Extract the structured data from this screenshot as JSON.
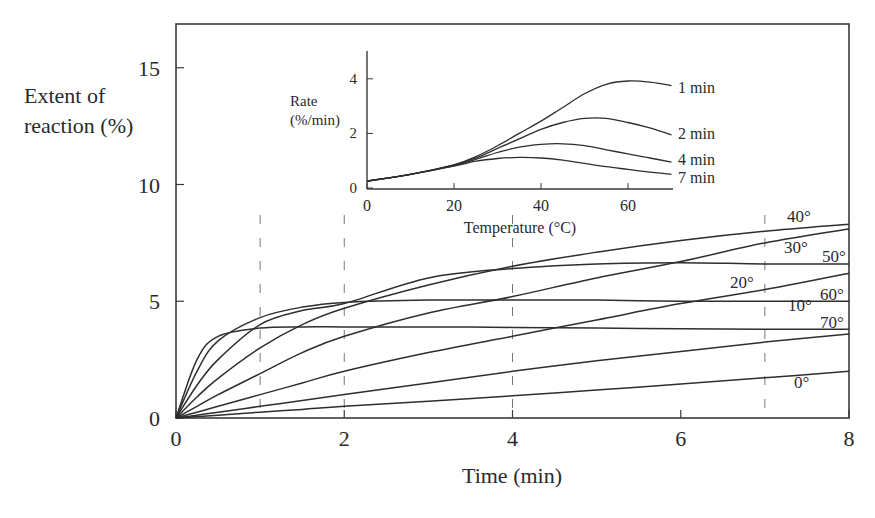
{
  "chart_data": [
    {
      "type": "line",
      "title": "",
      "xlabel": "Time (min)",
      "ylabel": "Extent of reaction (%)",
      "ylabel_lines": [
        "Extent of",
        "reaction (%)"
      ],
      "xlim": [
        0,
        8
      ],
      "ylim": [
        0,
        17
      ],
      "xticks": [
        0,
        2,
        4,
        6,
        8
      ],
      "xtick_labels": [
        "0",
        "2",
        "4",
        "6",
        "8"
      ],
      "minor_xticks": [
        1,
        7
      ],
      "yticks": [
        0,
        5,
        10,
        15
      ],
      "ytick_labels": [
        "0",
        "5",
        "10",
        "15"
      ],
      "grid": false,
      "dashed_guides_at_x": [
        1,
        2,
        4,
        7
      ],
      "legend": "inline labels at right end of curves",
      "x": [
        0,
        0.25,
        0.5,
        1,
        1.5,
        2,
        3,
        4,
        5,
        6,
        7,
        8
      ],
      "series": [
        {
          "name": "0°",
          "label": "0°",
          "values": [
            0,
            0.06,
            0.12,
            0.25,
            0.37,
            0.5,
            0.72,
            0.95,
            1.2,
            1.45,
            1.72,
            2.0
          ]
        },
        {
          "name": "10°",
          "label": "10°",
          "values": [
            0,
            0.12,
            0.25,
            0.5,
            0.75,
            1.0,
            1.5,
            2.0,
            2.45,
            2.85,
            3.25,
            3.6
          ]
        },
        {
          "name": "20°",
          "label": "20°",
          "values": [
            0,
            0.25,
            0.5,
            1.0,
            1.5,
            2.0,
            2.8,
            3.5,
            4.2,
            4.9,
            5.5,
            6.2
          ]
        },
        {
          "name": "30°",
          "label": "30°",
          "values": [
            0,
            0.5,
            1.0,
            1.9,
            2.8,
            3.5,
            4.5,
            5.2,
            6.0,
            6.7,
            7.5,
            8.1
          ]
        },
        {
          "name": "40°",
          "label": "40°",
          "values": [
            0,
            0.9,
            1.7,
            3.0,
            4.0,
            4.7,
            5.7,
            6.5,
            7.1,
            7.6,
            8.0,
            8.3
          ]
        },
        {
          "name": "50°",
          "label": "50°",
          "values": [
            0,
            1.4,
            2.5,
            4.0,
            4.6,
            4.9,
            6.0,
            6.4,
            6.6,
            6.65,
            6.6,
            6.6
          ]
        },
        {
          "name": "60°",
          "label": "60°",
          "values": [
            0,
            2.0,
            3.3,
            4.3,
            4.75,
            4.95,
            5.05,
            5.05,
            5.05,
            5.0,
            5.0,
            5.0
          ]
        },
        {
          "name": "70°",
          "label": "70°",
          "values": [
            0,
            2.5,
            3.5,
            3.85,
            3.9,
            3.9,
            3.9,
            3.88,
            3.85,
            3.82,
            3.8,
            3.8
          ]
        }
      ]
    },
    {
      "type": "line",
      "title": "",
      "xlabel": "Temperature (°C)",
      "ylabel": "Rate (%/min)",
      "ylabel_lines": [
        "Rate",
        "(%/min)"
      ],
      "xlim": [
        0,
        70
      ],
      "ylim": [
        0,
        5
      ],
      "xticks": [
        0,
        20,
        40,
        60
      ],
      "xtick_labels": [
        "0",
        "20",
        "40",
        "60"
      ],
      "yticks": [
        0,
        2,
        4
      ],
      "ytick_labels": [
        "0",
        "2",
        "4"
      ],
      "grid": false,
      "legend": "inline labels at right end of curves",
      "x": [
        0,
        10,
        20,
        25,
        30,
        35,
        40,
        45,
        50,
        55,
        60,
        65,
        70
      ],
      "series": [
        {
          "name": "1 min",
          "label": "1 min",
          "values": [
            0.25,
            0.5,
            0.85,
            1.15,
            1.55,
            2.0,
            2.45,
            2.95,
            3.45,
            3.8,
            3.92,
            3.88,
            3.75
          ]
        },
        {
          "name": "2 min",
          "label": "2 min",
          "values": [
            0.25,
            0.5,
            0.85,
            1.1,
            1.45,
            1.8,
            2.15,
            2.4,
            2.55,
            2.55,
            2.4,
            2.2,
            1.95
          ]
        },
        {
          "name": "4 min",
          "label": "4 min",
          "values": [
            0.25,
            0.5,
            0.82,
            1.05,
            1.3,
            1.5,
            1.6,
            1.62,
            1.55,
            1.4,
            1.25,
            1.1,
            0.95
          ]
        },
        {
          "name": "7 min",
          "label": "7 min",
          "values": [
            0.25,
            0.5,
            0.8,
            0.98,
            1.08,
            1.12,
            1.1,
            1.02,
            0.9,
            0.78,
            0.68,
            0.58,
            0.5
          ]
        }
      ]
    }
  ]
}
